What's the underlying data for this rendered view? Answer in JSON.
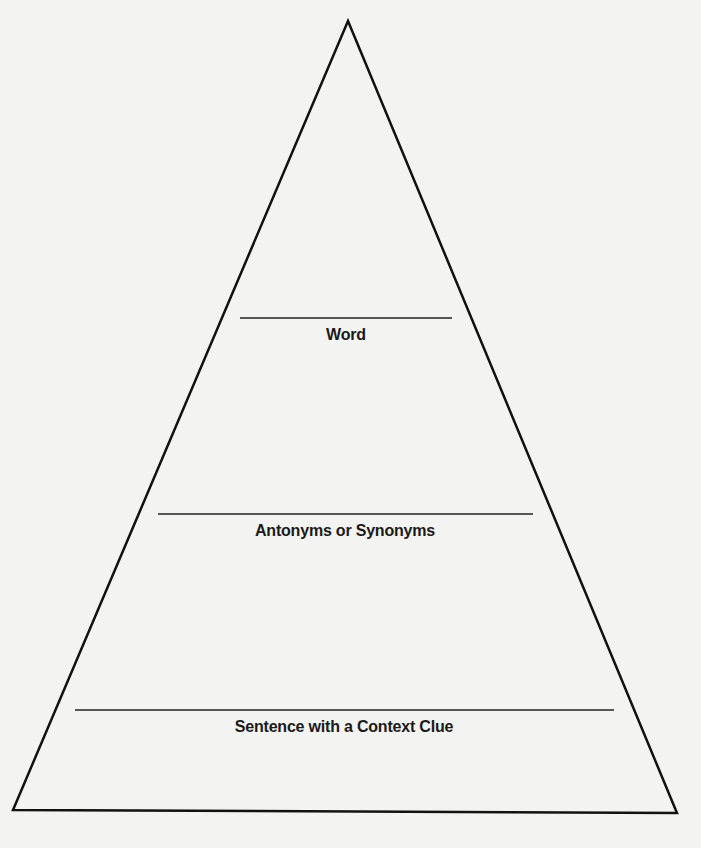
{
  "diagram": {
    "type": "vocabulary-pyramid",
    "levels": [
      {
        "label": "Word",
        "line": {
          "x1": 240,
          "x2": 452,
          "y": 318
        },
        "label_center_x": 346,
        "label_top": 326
      },
      {
        "label": "Antonyms or Synonyms",
        "line": {
          "x1": 158,
          "x2": 533,
          "y": 514
        },
        "label_center_x": 345,
        "label_top": 522
      },
      {
        "label": "Sentence with a Context Clue",
        "line": {
          "x1": 75,
          "x2": 614,
          "y": 710
        },
        "label_center_x": 344,
        "label_top": 718
      }
    ],
    "triangle": {
      "apex": [
        348,
        21
      ],
      "bottom_left": [
        13,
        810
      ],
      "bottom_right": [
        677,
        813
      ]
    },
    "colors": {
      "stroke": "#111111",
      "background": "#f3f3f1",
      "text": "#1a1a1a"
    }
  }
}
